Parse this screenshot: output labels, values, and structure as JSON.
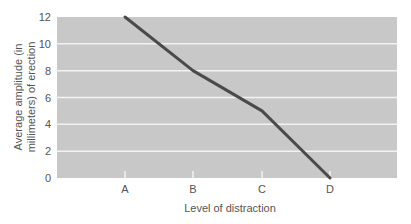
{
  "chart_data": {
    "type": "line",
    "title": "",
    "xlabel": "Level of distraction",
    "ylabel_line1": "Average amplitude (in",
    "ylabel_line2": "millimeters) of erection",
    "ylabel": "Average amplitude (in millimeters) of erection",
    "categories": [
      "A",
      "B",
      "C",
      "D"
    ],
    "values": [
      12,
      8,
      5,
      0
    ],
    "yticks": [
      0,
      2,
      4,
      6,
      8,
      10,
      12
    ],
    "ylim": [
      0,
      12
    ],
    "grid": true,
    "legend": null,
    "colors": {
      "plot_bg": "#c8c8c8",
      "grid": "#f2f2f2",
      "line": "#4a4a4a",
      "text": "#555555"
    }
  }
}
